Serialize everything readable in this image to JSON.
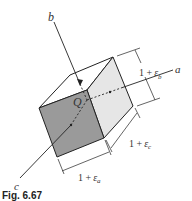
{
  "figure": {
    "caption": "Fig. 6.67",
    "axes": {
      "a": "a",
      "b": "b",
      "c": "c"
    },
    "origin_label": "Q",
    "dimensions": {
      "b": {
        "one": "1 +",
        "eps": "ε",
        "sub": "b"
      },
      "c": {
        "one": "1 +",
        "eps": "ε",
        "sub": "c"
      },
      "a": {
        "one": "1 +",
        "eps": "ε",
        "sub": "a"
      }
    },
    "colors": {
      "front_face": "#9a9a9a",
      "side_face": "#e6e6e6",
      "top_face": "#ffffff",
      "line": "#222222"
    }
  }
}
